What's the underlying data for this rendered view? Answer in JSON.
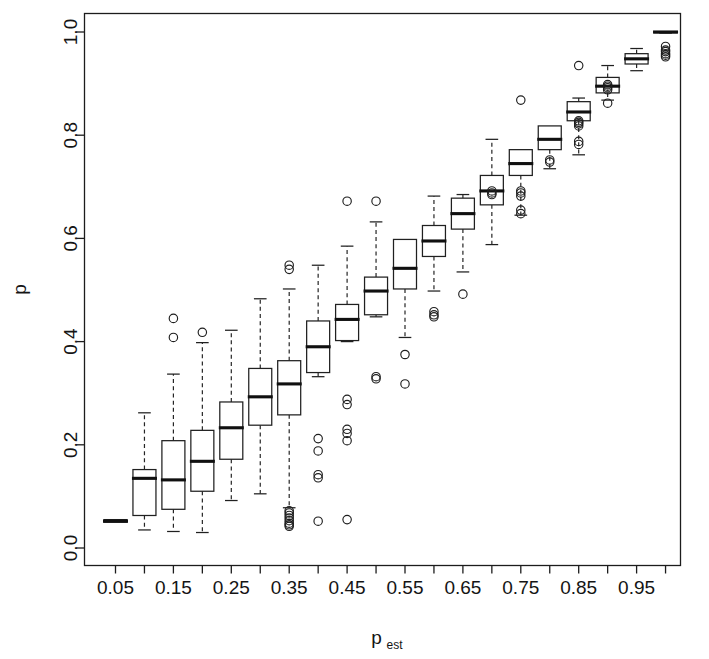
{
  "chart_data": {
    "type": "box",
    "title": "",
    "xlabel": "p_est",
    "xlabel_base": "p",
    "xlabel_sub": "est",
    "ylabel": "p",
    "xlim": [
      0.0,
      1.0
    ],
    "ylim": [
      0.0,
      1.0
    ],
    "grid": false,
    "legend": "none",
    "ytick_labels": [
      "0.0",
      "0.2",
      "0.4",
      "0.6",
      "0.8",
      "1.0"
    ],
    "ytick_values": [
      0.0,
      0.2,
      0.4,
      0.6,
      0.8,
      1.0
    ],
    "xtick_labels": [
      "0.05",
      "",
      "0.15",
      "",
      "0.25",
      "",
      "0.35",
      "",
      "0.45",
      "",
      "0.55",
      "",
      "0.65",
      "",
      "0.75",
      "",
      "0.85",
      "",
      "0.95",
      ""
    ],
    "xtick_values": [
      0.05,
      0.1,
      0.15,
      0.2,
      0.25,
      0.3,
      0.35,
      0.4,
      0.45,
      0.5,
      0.55,
      0.6,
      0.65,
      0.7,
      0.75,
      0.8,
      0.85,
      0.9,
      0.95,
      1.0
    ],
    "categories": [
      "0.05",
      "0.10",
      "0.15",
      "0.20",
      "0.25",
      "0.30",
      "0.35",
      "0.40",
      "0.45",
      "0.50",
      "0.55",
      "0.60",
      "0.65",
      "0.70",
      "0.75",
      "0.80",
      "0.85",
      "0.90",
      "0.95",
      "1.00"
    ],
    "boxes": [
      {
        "category": "0.05",
        "min": 0.05,
        "q1": 0.05,
        "median": 0.052,
        "q3": 0.055,
        "max": 0.055,
        "outliers": []
      },
      {
        "category": "0.10",
        "min": 0.035,
        "q1": 0.063,
        "median": 0.135,
        "q3": 0.152,
        "max": 0.262,
        "outliers": []
      },
      {
        "category": "0.15",
        "min": 0.032,
        "q1": 0.075,
        "median": 0.132,
        "q3": 0.208,
        "max": 0.337,
        "outliers": [
          0.408,
          0.445
        ]
      },
      {
        "category": "0.20",
        "min": 0.03,
        "q1": 0.11,
        "median": 0.168,
        "q3": 0.228,
        "max": 0.398,
        "outliers": [
          0.418
        ]
      },
      {
        "category": "0.25",
        "min": 0.092,
        "q1": 0.172,
        "median": 0.233,
        "q3": 0.283,
        "max": 0.422,
        "outliers": []
      },
      {
        "category": "0.30",
        "min": 0.105,
        "q1": 0.238,
        "median": 0.293,
        "q3": 0.348,
        "max": 0.483,
        "outliers": []
      },
      {
        "category": "0.35",
        "min": 0.078,
        "q1": 0.258,
        "median": 0.318,
        "q3": 0.363,
        "max": 0.502,
        "outliers": [
          0.54,
          0.548,
          0.072,
          0.068,
          0.063,
          0.058,
          0.053,
          0.048,
          0.045,
          0.042
        ]
      },
      {
        "category": "0.40",
        "min": 0.332,
        "q1": 0.34,
        "median": 0.39,
        "q3": 0.44,
        "max": 0.548,
        "outliers": [
          0.212,
          0.188,
          0.142,
          0.136,
          0.052
        ]
      },
      {
        "category": "0.45",
        "min": 0.4,
        "q1": 0.402,
        "median": 0.443,
        "q3": 0.472,
        "max": 0.585,
        "outliers": [
          0.672,
          0.288,
          0.278,
          0.23,
          0.222,
          0.208,
          0.055
        ]
      },
      {
        "category": "0.50",
        "min": 0.448,
        "q1": 0.452,
        "median": 0.498,
        "q3": 0.525,
        "max": 0.632,
        "outliers": [
          0.672,
          0.332,
          0.328
        ]
      },
      {
        "category": "0.55",
        "min": 0.408,
        "q1": 0.502,
        "median": 0.542,
        "q3": 0.598,
        "max": 0.552,
        "outliers": [
          0.375,
          0.318
        ]
      },
      {
        "category": "0.60",
        "min": 0.498,
        "q1": 0.565,
        "median": 0.595,
        "q3": 0.625,
        "max": 0.682,
        "outliers": [
          0.458,
          0.452,
          0.448
        ]
      },
      {
        "category": "0.65",
        "min": 0.535,
        "q1": 0.618,
        "median": 0.648,
        "q3": 0.678,
        "max": 0.685,
        "outliers": [
          0.492
        ]
      },
      {
        "category": "0.70",
        "min": 0.588,
        "q1": 0.665,
        "median": 0.692,
        "q3": 0.722,
        "max": 0.792,
        "outliers": [
          0.692,
          0.688,
          0.685
        ]
      },
      {
        "category": "0.75",
        "min": 0.645,
        "q1": 0.722,
        "median": 0.745,
        "q3": 0.772,
        "max": 0.765,
        "outliers": [
          0.868,
          0.692,
          0.688,
          0.682,
          0.655,
          0.648
        ]
      },
      {
        "category": "0.80",
        "min": 0.735,
        "q1": 0.772,
        "median": 0.792,
        "q3": 0.818,
        "max": 0.805,
        "outliers": [
          0.752,
          0.748
        ]
      },
      {
        "category": "0.85",
        "min": 0.762,
        "q1": 0.828,
        "median": 0.845,
        "q3": 0.865,
        "max": 0.872,
        "outliers": [
          0.935,
          0.828,
          0.825,
          0.822,
          0.818,
          0.788,
          0.782
        ]
      },
      {
        "category": "0.90",
        "min": 0.868,
        "q1": 0.882,
        "median": 0.895,
        "q3": 0.912,
        "max": 0.935,
        "outliers": [
          0.898,
          0.895,
          0.892,
          0.888,
          0.862
        ]
      },
      {
        "category": "0.95",
        "min": 0.925,
        "q1": 0.938,
        "median": 0.948,
        "q3": 0.958,
        "max": 0.968,
        "outliers": []
      },
      {
        "category": "1.00",
        "min": 0.998,
        "q1": 0.999,
        "median": 1.0,
        "q3": 1.0,
        "max": 1.0,
        "outliers": [
          0.972,
          0.965,
          0.962,
          0.958,
          0.955,
          0.952
        ]
      }
    ]
  },
  "accent_color": "#000000",
  "background_color": "#ffffff"
}
